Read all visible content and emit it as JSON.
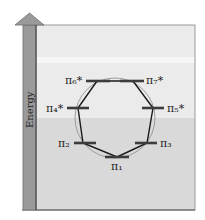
{
  "diagram": {
    "type": "frost-circle-mo-energy-diagram",
    "axis": {
      "label": "Energy",
      "direction": "up"
    },
    "colors": {
      "arrow_fill": "#9a9a9a",
      "arrow_stroke": "#6e6e6e",
      "upper_bg": "#ebebeb",
      "upper_band": "#f4f4f4",
      "lower_bg": "#d9d9d9",
      "frame": "#555555",
      "level": "#3c3c3c",
      "polygon": "#1a1a1a",
      "circle": "#8a8a8a"
    },
    "levels": [
      {
        "id": "pi1",
        "symbol": "π",
        "sub": "1",
        "star": "",
        "x": 117,
        "y": 157,
        "label_pos": "below"
      },
      {
        "id": "pi2",
        "symbol": "π",
        "sub": "2",
        "star": "",
        "x": 83,
        "y": 143,
        "label_pos": "left"
      },
      {
        "id": "pi3",
        "symbol": "π",
        "sub": "3",
        "star": "",
        "x": 147,
        "y": 143,
        "label_pos": "right"
      },
      {
        "id": "pi4",
        "symbol": "π",
        "sub": "4",
        "star": "*",
        "x": 78,
        "y": 108,
        "label_pos": "left"
      },
      {
        "id": "pi5",
        "symbol": "π",
        "sub": "5",
        "star": "*",
        "x": 153,
        "y": 108,
        "label_pos": "right"
      },
      {
        "id": "pi6",
        "symbol": "π",
        "sub": "6",
        "star": "*",
        "x": 97,
        "y": 81,
        "label_pos": "left"
      },
      {
        "id": "pi7",
        "symbol": "π",
        "sub": "7",
        "star": "*",
        "x": 133,
        "y": 81,
        "label_pos": "right"
      }
    ],
    "labels": {
      "pi1": "π₁",
      "pi2": "π₂",
      "pi3": "π₃",
      "pi4": "π₄*",
      "pi5": "π₅*",
      "pi6": "π₆*",
      "pi7": "π₇*"
    }
  }
}
